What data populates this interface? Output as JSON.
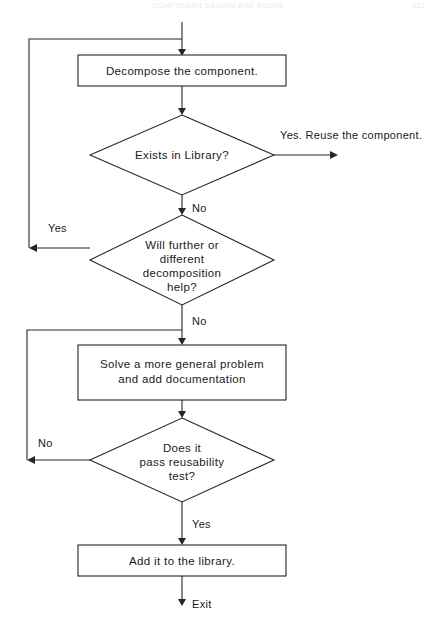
{
  "page": {
    "running_head_title": "COMPONENT DESIGN AND REUSE",
    "page_number": "321",
    "width": 446,
    "height": 619,
    "background": "#ffffff",
    "ink_color": "#262626",
    "text_color": "#1a1a1a"
  },
  "diagram": {
    "type": "flowchart",
    "nodes": [
      {
        "id": "decompose",
        "shape": "process",
        "lines": [
          "Decompose the component."
        ],
        "x": 78,
        "y": 55,
        "w": 208,
        "h": 31
      },
      {
        "id": "exists_in_library",
        "shape": "decision",
        "lines": [
          "Exists in Library?"
        ],
        "cx": 182,
        "cy": 155,
        "rx": 92,
        "ry": 40
      },
      {
        "id": "further_decomposition",
        "shape": "decision",
        "lines": [
          "Will further or",
          "different",
          "decomposition",
          "help?"
        ],
        "cx": 182,
        "cy": 260,
        "rx": 92,
        "ry": 45
      },
      {
        "id": "solve_general",
        "shape": "process",
        "lines": [
          "Solve a more general problem",
          "and add documentation"
        ],
        "x": 78,
        "y": 345,
        "w": 208,
        "h": 55
      },
      {
        "id": "reusability_test",
        "shape": "decision",
        "lines": [
          "Does it",
          "pass reusability",
          "test?"
        ],
        "cx": 182,
        "cy": 460,
        "rx": 92,
        "ry": 42
      },
      {
        "id": "add_to_library",
        "shape": "process",
        "lines": [
          "Add it to the library."
        ],
        "x": 78,
        "y": 545,
        "w": 208,
        "h": 31
      }
    ],
    "edge_labels": [
      {
        "id": "label-reuse",
        "text": "Yes. Reuse the component.",
        "x": 280,
        "y": 139
      },
      {
        "id": "label-no-1",
        "text": "No",
        "x": 192,
        "y": 212
      },
      {
        "id": "label-yes-1",
        "text": "Yes",
        "x": 48,
        "y": 232
      },
      {
        "id": "label-no-2",
        "text": "No",
        "x": 192,
        "y": 325
      },
      {
        "id": "label-no-3",
        "text": "No",
        "x": 38,
        "y": 447
      },
      {
        "id": "label-yes-2",
        "text": "Yes",
        "x": 192,
        "y": 528
      },
      {
        "id": "label-exit",
        "text": "Exit",
        "x": 192,
        "y": 608
      }
    ]
  }
}
